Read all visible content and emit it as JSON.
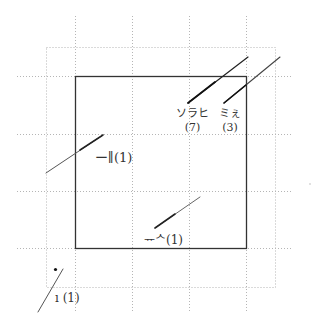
{
  "diagram": {
    "type": "grid-plot",
    "grid": {
      "vertical_lines_x": [
        75,
        132,
        189,
        246
      ],
      "horizontal_lines_y": [
        76,
        134,
        191,
        248
      ],
      "outer_dotted_box": {
        "x1": 46,
        "y1": 47,
        "x2": 275,
        "y2": 287
      },
      "line_style": "dotted",
      "color": "#b8b8b8"
    },
    "frame": {
      "x1": 75,
      "y1": 76,
      "x2": 246,
      "y2": 248,
      "color": "#333333"
    },
    "labels": [
      {
        "id": "label-sorahi",
        "text": "ソラヒ",
        "count": "(7)",
        "x": 183,
        "y": 108
      },
      {
        "id": "label-mie",
        "text": "ミぇ",
        "count": "(3)",
        "x": 221,
        "y": 108
      },
      {
        "id": "label-ichi",
        "text": "ー∥(1)",
        "x": 95,
        "y": 152
      },
      {
        "id": "label-bottom",
        "text": "ᅲᄉ(1)",
        "x": 145,
        "y": 236
      },
      {
        "id": "label-corner",
        "text": "ı (1)",
        "x": 55,
        "y": 292
      }
    ],
    "leader_lines": [
      {
        "from": [
          187,
          105
        ],
        "to": [
          248,
          56
        ],
        "label": "ソラヒ"
      },
      {
        "from": [
          223,
          105
        ],
        "to": [
          280,
          56
        ],
        "label": "ミぇ"
      },
      {
        "from": [
          46,
          173
        ],
        "to": [
          103,
          135
        ],
        "label": "ー∥"
      },
      {
        "from": [
          155,
          228
        ],
        "to": [
          200,
          197
        ],
        "label": "ᅲᄉ"
      },
      {
        "from": [
          38,
          312
        ],
        "to": [
          63,
          269
        ],
        "label": "ı"
      }
    ],
    "points": [
      {
        "x": 55,
        "y": 270
      }
    ]
  }
}
